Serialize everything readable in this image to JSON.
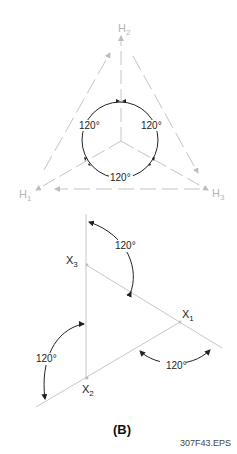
{
  "figure": {
    "panel_label": "(B)",
    "file_id": "307F43.EPS",
    "colors": {
      "grey_line": "#c4c4c4",
      "grey_text": "#b4b4b4",
      "dark": "#222222"
    },
    "top_diagram": {
      "axes": [
        {
          "label": "H",
          "sub": "2"
        },
        {
          "label": "H",
          "sub": "1"
        },
        {
          "label": "H",
          "sub": "3"
        }
      ],
      "angles": [
        "120°",
        "120°",
        "120°"
      ]
    },
    "bottom_diagram": {
      "points": [
        {
          "label": "X",
          "sub": "3"
        },
        {
          "label": "X",
          "sub": "1"
        },
        {
          "label": "X",
          "sub": "2"
        }
      ],
      "angles": [
        "120°",
        "120°",
        "120°"
      ]
    }
  }
}
